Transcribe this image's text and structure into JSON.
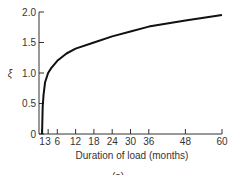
{
  "chart_data": {
    "type": "line",
    "title": "",
    "xlabel": "Duration of load (months)",
    "ylabel": "ξ",
    "xlim": [
      0,
      60
    ],
    "ylim": [
      0,
      2.0
    ],
    "grid": false,
    "legend": null,
    "x_ticks": [
      1,
      3,
      6,
      12,
      18,
      24,
      30,
      36,
      48,
      60
    ],
    "y_ticks": [
      "0",
      "0.5",
      "1.0",
      "1.5",
      "2.0"
    ],
    "series": [
      {
        "name": "time-dependent factor ξ",
        "x": [
          1,
          1.2,
          1.5,
          2,
          3,
          4,
          6,
          9,
          12,
          18,
          24,
          30,
          36,
          48,
          60
        ],
        "y": [
          0,
          0.45,
          0.65,
          0.85,
          1.0,
          1.08,
          1.2,
          1.32,
          1.4,
          1.5,
          1.6,
          1.68,
          1.76,
          1.86,
          1.95
        ]
      }
    ]
  },
  "caption_fragment": "(a)"
}
